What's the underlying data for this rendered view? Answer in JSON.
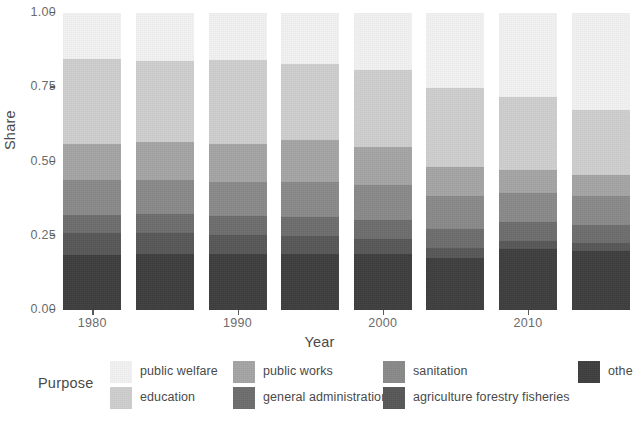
{
  "chart_data": {
    "type": "bar",
    "stacked": true,
    "stack_normalized": true,
    "title": "",
    "xlabel": "Year",
    "ylabel": "Share",
    "legend_title": "Purpose",
    "legend_position": "bottom",
    "grid": false,
    "ylim": [
      0.0,
      1.0
    ],
    "ytick_labels": [
      "0.00",
      "0.25",
      "0.50",
      "0.75",
      "1.00"
    ],
    "ytick_values": [
      0.0,
      0.25,
      0.5,
      0.75,
      1.0
    ],
    "categories": [
      "1980",
      "1985",
      "1990",
      "1995",
      "2000",
      "2005",
      "2010",
      "2015"
    ],
    "xtick_labels": [
      "1980",
      "1990",
      "2000",
      "2010"
    ],
    "xtick_categories": [
      "1980",
      "1990",
      "2000",
      "2010"
    ],
    "series": [
      {
        "name": "other",
        "color": "#3f3f3f",
        "values": [
          0.185,
          0.19,
          0.19,
          0.19,
          0.19,
          0.175,
          0.205,
          0.2
        ]
      },
      {
        "name": "agriculture forestry fisheries",
        "color": "#585858",
        "values": [
          0.075,
          0.07,
          0.062,
          0.058,
          0.048,
          0.035,
          0.028,
          0.025
        ]
      },
      {
        "name": "general administration",
        "color": "#6e6e6e",
        "values": [
          0.06,
          0.062,
          0.063,
          0.065,
          0.065,
          0.063,
          0.062,
          0.06
        ]
      },
      {
        "name": "sanitation",
        "color": "#8a8a8a",
        "values": [
          0.118,
          0.115,
          0.115,
          0.118,
          0.118,
          0.112,
          0.1,
          0.098
        ]
      },
      {
        "name": "public works",
        "color": "#a5a5a5",
        "values": [
          0.122,
          0.128,
          0.13,
          0.14,
          0.128,
          0.098,
          0.075,
          0.072
        ]
      },
      {
        "name": "education",
        "color": "#cfcfcf",
        "values": [
          0.285,
          0.272,
          0.283,
          0.258,
          0.258,
          0.265,
          0.248,
          0.218
        ]
      },
      {
        "name": "public welfare",
        "color": "#f2f2f2",
        "values": [
          0.155,
          0.163,
          0.157,
          0.171,
          0.193,
          0.252,
          0.282,
          0.327
        ]
      }
    ],
    "legend_entries": [
      {
        "label": "public welfare",
        "color": "#f2f2f2"
      },
      {
        "label": "education",
        "color": "#cfcfcf"
      },
      {
        "label": "public works",
        "color": "#a5a5a5"
      },
      {
        "label": "general administration",
        "color": "#6e6e6e"
      },
      {
        "label": "sanitation",
        "color": "#8a8a8a"
      },
      {
        "label": "agriculture forestry fisheries",
        "color": "#585858"
      },
      {
        "label": "othe",
        "color": "#3f3f3f"
      }
    ],
    "legend_layout": [
      {
        "label": "public welfare",
        "color": "#f2f2f2",
        "left": 110,
        "top": 2
      },
      {
        "label": "education",
        "color": "#cfcfcf",
        "left": 110,
        "top": 28
      },
      {
        "label": "public works",
        "color": "#a5a5a5",
        "left": 233,
        "top": 2
      },
      {
        "label": "general administration",
        "color": "#6e6e6e",
        "left": 233,
        "top": 28
      },
      {
        "label": "sanitation",
        "color": "#8a8a8a",
        "left": 383,
        "top": 2
      },
      {
        "label": "agriculture forestry fisheries",
        "color": "#585858",
        "left": 383,
        "top": 28
      },
      {
        "label": "othe",
        "color": "#3f3f3f",
        "left": 578,
        "top": 2
      }
    ]
  }
}
